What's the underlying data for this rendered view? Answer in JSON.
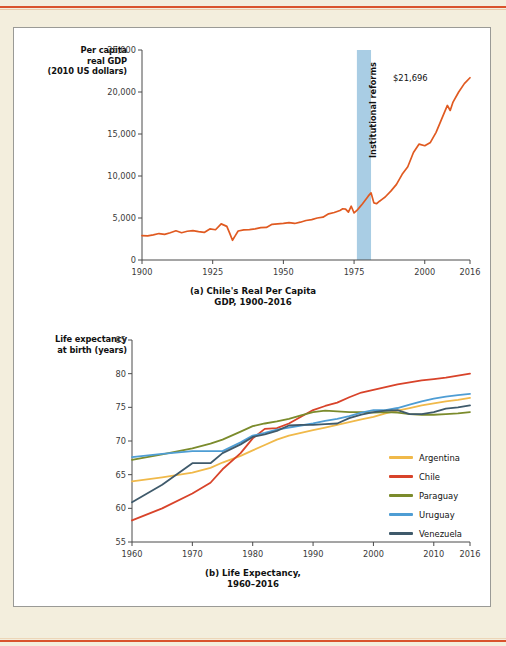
{
  "page": {
    "background_color": "#f3eedd",
    "rule_color": "#d9532c",
    "panel_background": "#ffffff",
    "panel_border_color": "#9a9a96"
  },
  "figure_a": {
    "ylabel": "Per capita\nreal GDP\n(2010 US dollars)",
    "ylabel_lines": [
      "Per capita",
      "real GDP",
      "(2010 US dollars)"
    ],
    "caption_lines": [
      "(a) Chile's Real Per Capita",
      "GDP, 1900–2016"
    ],
    "annotation": "$21,696",
    "band_label": "Institutional reforms",
    "band_color": "#a9cde4",
    "line_color": "#e05a21"
  },
  "figure_b": {
    "ylabel_lines": [
      "Life expectancy",
      "at birth (years)"
    ],
    "caption_lines": [
      "(b) Life Expectancy,",
      "1960–2016"
    ],
    "legend": [
      {
        "label": "Argentina",
        "color": "#f0b94a"
      },
      {
        "label": "Chile",
        "color": "#d8432a"
      },
      {
        "label": "Paraguay",
        "color": "#7b8b2c"
      },
      {
        "label": "Uruguay",
        "color": "#4e9dd4"
      },
      {
        "label": "Venezuela",
        "color": "#3f5a6b"
      }
    ]
  },
  "chart_data": [
    {
      "type": "line",
      "id": "chile-gdp",
      "title": "(a) Chile's Real Per Capita GDP, 1900–2016",
      "xlabel": "",
      "ylabel": "Per capita real GDP (2010 US dollars)",
      "xlim": [
        1900,
        2016
      ],
      "ylim": [
        0,
        25000
      ],
      "xticks": [
        1900,
        1925,
        1950,
        1975,
        2000,
        2016
      ],
      "yticks": [
        0,
        5000,
        10000,
        15000,
        20000,
        25000
      ],
      "grid": false,
      "legend": "none",
      "annotations": [
        {
          "text": "$21,696",
          "x": 2014,
          "y": 21696
        },
        {
          "text": "Institutional reforms",
          "x_span": [
            1976,
            1981
          ],
          "type": "vertical-band",
          "color": "#a9cde4"
        }
      ],
      "series": [
        {
          "name": "Chile",
          "color": "#e05a21",
          "x": [
            1900,
            1902,
            1904,
            1906,
            1908,
            1910,
            1912,
            1914,
            1916,
            1918,
            1920,
            1922,
            1924,
            1926,
            1928,
            1930,
            1931,
            1932,
            1933,
            1934,
            1936,
            1938,
            1940,
            1942,
            1944,
            1946,
            1948,
            1950,
            1952,
            1954,
            1956,
            1958,
            1960,
            1962,
            1964,
            1966,
            1968,
            1970,
            1971,
            1972,
            1973,
            1974,
            1975,
            1976,
            1977,
            1978,
            1979,
            1980,
            1981,
            1982,
            1983,
            1984,
            1985,
            1986,
            1988,
            1990,
            1992,
            1994,
            1996,
            1998,
            2000,
            2002,
            2004,
            2006,
            2008,
            2009,
            2010,
            2012,
            2014,
            2016
          ],
          "y": [
            2900,
            2880,
            3000,
            3150,
            3050,
            3250,
            3480,
            3250,
            3420,
            3500,
            3380,
            3280,
            3700,
            3600,
            4300,
            4000,
            3200,
            2350,
            2900,
            3450,
            3580,
            3620,
            3700,
            3850,
            3880,
            4250,
            4300,
            4350,
            4450,
            4350,
            4500,
            4700,
            4800,
            5000,
            5100,
            5500,
            5650,
            5900,
            6100,
            6050,
            5700,
            6400,
            5600,
            5900,
            6300,
            6700,
            7150,
            7600,
            8000,
            6800,
            6700,
            7000,
            7250,
            7500,
            8200,
            9000,
            10200,
            11100,
            12800,
            13800,
            13600,
            14000,
            15200,
            16800,
            18400,
            17800,
            18800,
            20000,
            21000,
            21696
          ]
        }
      ]
    },
    {
      "type": "line",
      "id": "life-expectancy",
      "title": "(b) Life Expectancy, 1960–2016",
      "xlabel": "",
      "ylabel": "Life expectancy at birth (years)",
      "xlim": [
        1960,
        2016
      ],
      "ylim": [
        55,
        85
      ],
      "xticks": [
        1960,
        1970,
        1980,
        1990,
        2000,
        2010,
        2016
      ],
      "yticks": [
        55,
        60,
        65,
        70,
        75,
        80,
        85
      ],
      "grid": false,
      "legend": "right",
      "x": [
        1960,
        1965,
        1970,
        1973,
        1975,
        1978,
        1980,
        1982,
        1984,
        1986,
        1988,
        1990,
        1992,
        1994,
        1996,
        1998,
        2000,
        2002,
        2004,
        2006,
        2008,
        2010,
        2012,
        2014,
        2016
      ],
      "series": [
        {
          "name": "Argentina",
          "color": "#f0b94a",
          "values": [
            64.0,
            64.6,
            65.3,
            66.0,
            66.8,
            67.8,
            68.6,
            69.4,
            70.2,
            70.8,
            71.2,
            71.6,
            72.0,
            72.4,
            72.8,
            73.2,
            73.6,
            74.1,
            74.5,
            74.9,
            75.3,
            75.6,
            75.9,
            76.1,
            76.4
          ]
        },
        {
          "name": "Chile",
          "color": "#d8432a",
          "values": [
            58.2,
            60.0,
            62.2,
            63.8,
            65.8,
            68.2,
            70.4,
            71.8,
            71.9,
            72.6,
            73.6,
            74.6,
            75.2,
            75.7,
            76.5,
            77.2,
            77.6,
            78.0,
            78.4,
            78.7,
            79.0,
            79.2,
            79.4,
            79.7,
            80.0
          ]
        },
        {
          "name": "Paraguay",
          "color": "#7b8b2c",
          "values": [
            67.2,
            68.0,
            68.9,
            69.6,
            70.2,
            71.4,
            72.2,
            72.6,
            72.9,
            73.3,
            73.8,
            74.3,
            74.5,
            74.4,
            74.3,
            74.3,
            74.2,
            74.3,
            74.2,
            74.0,
            73.9,
            73.9,
            74.0,
            74.1,
            74.3
          ]
        },
        {
          "name": "Uruguay",
          "color": "#4e9dd4",
          "values": [
            67.6,
            68.1,
            68.5,
            68.5,
            68.5,
            69.8,
            70.8,
            71.2,
            71.7,
            72.0,
            72.3,
            72.6,
            73.0,
            73.3,
            73.7,
            74.2,
            74.6,
            74.6,
            74.9,
            75.4,
            75.9,
            76.3,
            76.6,
            76.8,
            77.0
          ]
        },
        {
          "name": "Venezuela",
          "color": "#3f5a6b",
          "values": [
            60.9,
            63.5,
            66.7,
            66.7,
            68.2,
            69.5,
            70.6,
            71.0,
            71.5,
            72.3,
            72.4,
            72.4,
            72.5,
            72.6,
            73.4,
            73.9,
            74.3,
            74.5,
            74.6,
            74.0,
            74.0,
            74.3,
            74.8,
            75.0,
            75.3
          ]
        }
      ]
    }
  ]
}
